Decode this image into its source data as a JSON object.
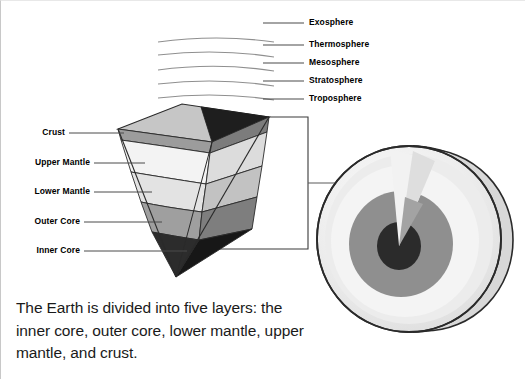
{
  "figure": {
    "caption": "The Earth is divided into five layers: the inner core, outer core, lower mantle, upper mantle, and crust."
  },
  "atmosphere": {
    "title": "Atmosphere layers",
    "layers": [
      {
        "label": "Exosphere",
        "label_x": 308,
        "label_y": 18,
        "line_x1": 262,
        "line_x2": 303,
        "line_y": 22,
        "arc": null
      },
      {
        "label": "Thermosphere",
        "label_x": 308,
        "label_y": 40,
        "line_x1": 262,
        "line_x2": 303,
        "line_y": 44,
        "arc": {
          "x1": 157,
          "y1": 40,
          "cx": 215,
          "cy": 34,
          "x2": 272,
          "y2": 41
        }
      },
      {
        "label": "Mesosphere",
        "label_x": 308,
        "label_y": 58,
        "line_x1": 262,
        "line_x2": 303,
        "line_y": 62,
        "arc": {
          "x1": 157,
          "y1": 53,
          "cx": 215,
          "cy": 48,
          "x2": 272,
          "y2": 56
        }
      },
      {
        "label": "Stratosphere",
        "label_x": 308,
        "label_y": 76,
        "line_x1": 262,
        "line_x2": 303,
        "line_y": 80,
        "arc": {
          "x1": 157,
          "y1": 68,
          "cx": 215,
          "cy": 62,
          "x2": 272,
          "y2": 70
        }
      },
      {
        "label": "Troposphere",
        "label_x": 308,
        "label_y": 94,
        "line_x1": 262,
        "line_x2": 303,
        "line_y": 98,
        "arc": {
          "x1": 157,
          "y1": 82,
          "cx": 215,
          "cy": 77,
          "x2": 272,
          "y2": 85
        }
      }
    ],
    "extra_arc": {
      "x1": 157,
      "y1": 96,
      "cx": 215,
      "cy": 91,
      "x2": 272,
      "y2": 99
    }
  },
  "wedge": {
    "title": "Earth cutaway wedge",
    "labels": [
      {
        "label": "Crust",
        "label_x": 30,
        "label_y": 128,
        "line_x1": 68,
        "line_x2": 122,
        "line_y": 132
      },
      {
        "label": "Upper Mantle",
        "label_x": 30,
        "label_y": 158,
        "line_x1": 91,
        "line_x2": 143,
        "line_y": 162
      },
      {
        "label": "Lower Mantle",
        "label_x": 30,
        "label_y": 187,
        "line_x1": 91,
        "line_x2": 150,
        "line_y": 191
      },
      {
        "label": "Outer Core",
        "label_x": 30,
        "label_y": 217,
        "line_x1": 81,
        "line_x2": 160,
        "line_y": 221
      },
      {
        "label": "Inner Core",
        "label_x": 30,
        "label_y": 246,
        "line_x1": 81,
        "line_x2": 170,
        "line_y": 250
      }
    ]
  },
  "colors": {
    "outline": "#1a1a1a",
    "leader_line": "#555555",
    "arc_line": "#8a8a8a",
    "crust_front": "#9e9e9e",
    "crust_side": "#7d7d7d",
    "upper_mantle_front": "#f2f2f2",
    "upper_mantle_side": "#d6d6d6",
    "lower_mantle_front": "#e2e2e2",
    "lower_mantle_side": "#bdbdbd",
    "outer_core_front": "#a0a0a0",
    "outer_core_side": "#7a7a7a",
    "inner_core_front": "#2b2b2b",
    "inner_core_side": "#161616",
    "top_face": "#c4c4c4",
    "top_face_dark": "#1e1e1e",
    "sphere_shell": "#dcdcdc",
    "sphere_outer": "#ededed",
    "sphere_mid": "#8c8c8c",
    "sphere_core": "#2b2b2b",
    "sphere_highlight": "#f7f7f7",
    "background": "#ffffff"
  },
  "sphere": {
    "title": "Earth cross-section sphere",
    "connector_line": {
      "x1": 307,
      "x2": 415,
      "y": 182
    }
  },
  "connector_box": {
    "title": "Callout box",
    "x1": 268,
    "y1": 116,
    "x2": 307,
    "y2": 248,
    "bottom_left_x": 215
  }
}
